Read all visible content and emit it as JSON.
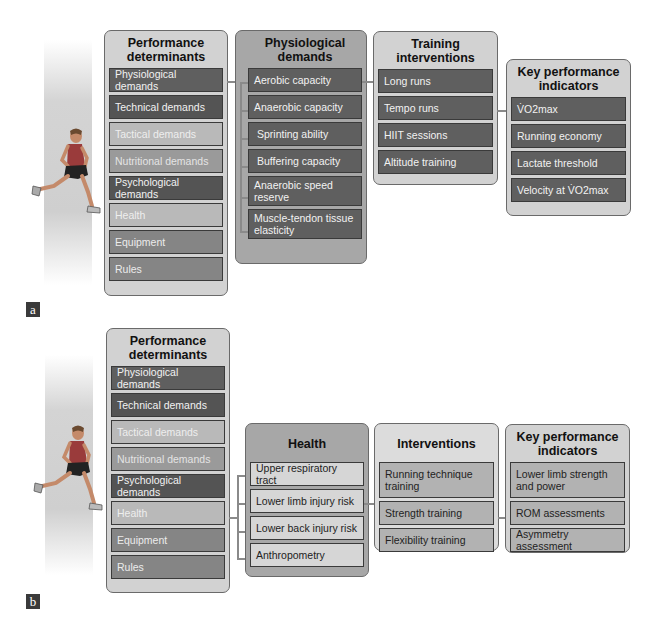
{
  "panel_a": {
    "label": "a",
    "performance_determinants": {
      "title": "Performance determinants",
      "items": [
        "Physiological demands",
        "Technical demands",
        "Tactical demands",
        "Nutritional demands",
        "Psychological demands",
        "Health",
        "Equipment",
        "Rules"
      ]
    },
    "physiological_demands": {
      "title": "Physiological demands",
      "items": [
        "Aerobic capacity",
        "Anaerobic capacity",
        "Sprinting ability",
        "Buffering capacity",
        "Anaerobic speed reserve",
        "Muscle-tendon tissue elasticity"
      ]
    },
    "training_interventions": {
      "title": "Training interventions",
      "items": [
        "Long runs",
        "Tempo runs",
        "HIIT sessions",
        "Altitude training"
      ]
    },
    "key_performance_indicators": {
      "title": "Key performance indicators",
      "items": [
        "V̇O2max",
        "Running economy",
        "Lactate threshold",
        "Velocity at V̇O2max"
      ]
    }
  },
  "panel_b": {
    "label": "b",
    "performance_determinants": {
      "title": "Performance determinants",
      "items": [
        "Physiological demands",
        "Technical demands",
        "Tactical demands",
        "Nutritional demands",
        "Psychological demands",
        "Health",
        "Equipment",
        "Rules"
      ]
    },
    "health": {
      "title": "Health",
      "items": [
        "Upper respiratory tract",
        "Lower limb injury risk",
        "Lower back injury risk",
        "Anthropometry"
      ]
    },
    "interventions": {
      "title": "Interventions",
      "items": [
        "Running technique training",
        "Strength training",
        "Flexibility training"
      ]
    },
    "key_performance_indicators": {
      "title": "Key performance indicators",
      "items": [
        "Lower limb strength and power",
        "ROM assessments",
        "Asymmetry assessment"
      ]
    }
  },
  "colors": {
    "dark_item": "#5a5a5a",
    "mid_item": "#9a9a9a",
    "panel_bg": "#d2d2d2",
    "connector": "#8a8a8a"
  }
}
